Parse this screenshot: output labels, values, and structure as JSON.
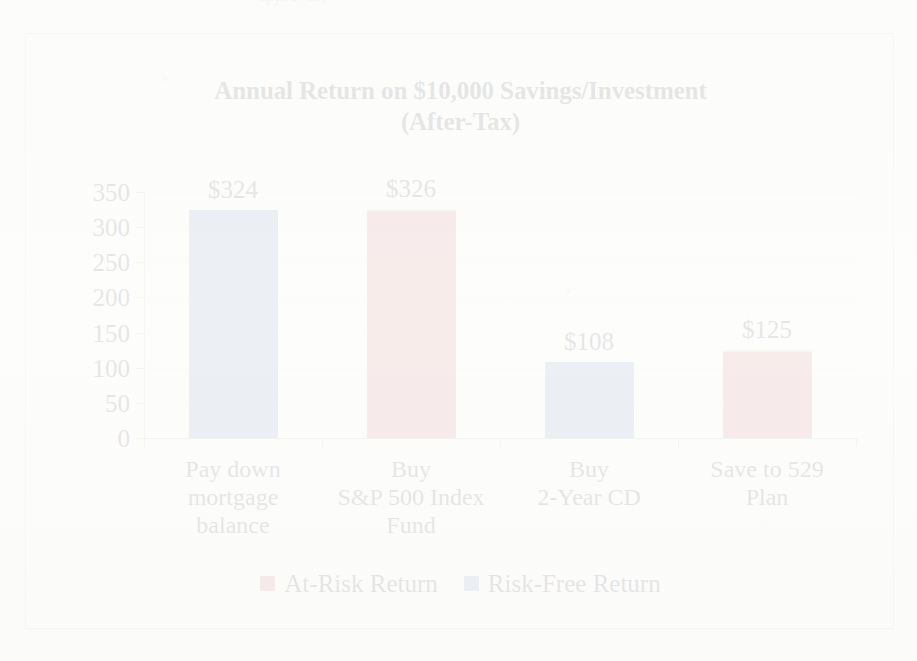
{
  "page": {
    "top_fragment": "approval,"
  },
  "chart_data": {
    "type": "bar",
    "title": "Annual Return on $10,000 Savings/Investment (After-Tax)",
    "title_line1": "Annual Return on $10,000 Savings/Investment",
    "title_line2": "(After-Tax)",
    "xlabel": "",
    "ylabel": "",
    "ylim": [
      0,
      350
    ],
    "ytick_step": 50,
    "grid": true,
    "legend_position": "bottom",
    "categories": [
      "Pay down mortgage balance",
      "Buy S&P 500 Index Fund",
      "Buy 2-Year CD",
      "Save to 529 Plan"
    ],
    "category_lines": [
      [
        "Pay down",
        "mortgage",
        "balance"
      ],
      [
        "Buy",
        "S&P 500 Index",
        "Fund"
      ],
      [
        "Buy",
        "2-Year CD"
      ],
      [
        "Save to 529",
        "Plan"
      ]
    ],
    "values": [
      324,
      326,
      108,
      125
    ],
    "data_labels": [
      "$324",
      "$326",
      "$108",
      "$125"
    ],
    "point_series": [
      "Risk-Free Return",
      "At-Risk Return",
      "Risk-Free Return",
      "At-Risk Return"
    ],
    "ytick_labels": [
      "350",
      "300",
      "250",
      "200",
      "150",
      "100",
      "50",
      "0"
    ],
    "ytick_values": [
      350,
      300,
      250,
      200,
      150,
      100,
      50,
      0
    ],
    "series": [
      {
        "name": "At-Risk Return",
        "color": "#C0504D",
        "values": [
          null,
          326,
          null,
          125
        ]
      },
      {
        "name": "Risk-Free Return",
        "color": "#4F81BD",
        "values": [
          324,
          null,
          108,
          null
        ]
      }
    ],
    "legend": [
      {
        "label": "At-Risk Return",
        "color": "#C0504D"
      },
      {
        "label": "Risk-Free Return",
        "color": "#4F81BD"
      }
    ]
  }
}
